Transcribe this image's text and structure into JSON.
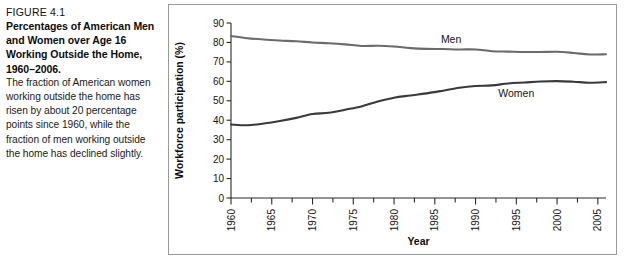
{
  "figure": {
    "label": "FIGURE 4.1",
    "title": "Percentages of American Men and Women over Age 16 Working Outside the Home, 1960–2006.",
    "body": "The fraction of American women working outside the home has risen by about 20 percentage points since 1960, while the fraction of men working outside the home has declined slightly."
  },
  "colors": {
    "men_line": "#6b6b6b",
    "women_line": "#3a3a3a",
    "axis": "#2a2a2a",
    "frame": "#9a9a9a",
    "background": "#ffffff"
  },
  "chart_data": {
    "type": "line",
    "title": "",
    "xlabel": "Year",
    "ylabel": "Workforce participation (%)",
    "xlim": [
      1960,
      2006
    ],
    "ylim": [
      0,
      90
    ],
    "ytick_labels": [
      "0",
      "10",
      "20",
      "30",
      "40",
      "50",
      "60",
      "70",
      "80",
      "90"
    ],
    "yticks": [
      0,
      10,
      20,
      30,
      40,
      50,
      60,
      70,
      80,
      90
    ],
    "xtick_labels": [
      "1960",
      "1965",
      "1970",
      "1975",
      "1980",
      "1985",
      "1990",
      "1995",
      "2000",
      "2005"
    ],
    "xticks": [
      1960,
      1965,
      1970,
      1975,
      1980,
      1985,
      1990,
      1995,
      2000,
      2005
    ],
    "xminor_step": 2.5,
    "grid": false,
    "legend_position": "inline-labels",
    "x": [
      1960,
      1962,
      1964,
      1966,
      1968,
      1970,
      1972,
      1974,
      1976,
      1978,
      1980,
      1982,
      1984,
      1986,
      1988,
      1990,
      1992,
      1994,
      1996,
      1998,
      2000,
      2002,
      2004,
      2006
    ],
    "series": [
      {
        "name": "Men",
        "label": "Men",
        "color": "#6b6b6b",
        "values": [
          83.3,
          82.2,
          81.5,
          81.0,
          80.6,
          80.0,
          79.6,
          79.0,
          78.2,
          78.3,
          77.9,
          77.1,
          76.7,
          76.6,
          76.4,
          76.4,
          75.5,
          75.3,
          75.1,
          75.1,
          75.2,
          74.6,
          73.8,
          73.9
        ]
      },
      {
        "name": "Women",
        "label": "Women",
        "color": "#3a3a3a",
        "values": [
          37.8,
          37.4,
          38.3,
          39.6,
          41.2,
          43.2,
          43.8,
          45.4,
          47.1,
          49.6,
          51.6,
          52.7,
          53.8,
          55.2,
          56.7,
          57.6,
          57.9,
          58.9,
          59.4,
          59.9,
          60.1,
          59.8,
          59.3,
          59.6
        ]
      }
    ],
    "annotations": [
      {
        "text": "Men",
        "x": 1987,
        "y": 79.5
      },
      {
        "text": "Women",
        "x": 1995,
        "y": 52.0
      }
    ]
  }
}
